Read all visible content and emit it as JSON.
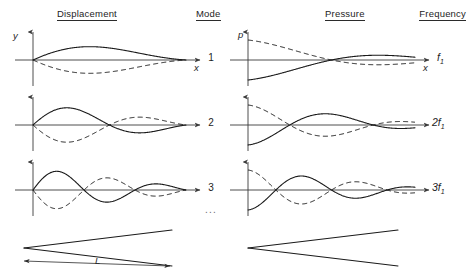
{
  "headers": {
    "displacement": "Displacement",
    "mode": "Mode",
    "pressure": "Pressure",
    "frequency": "Frequency"
  },
  "axis_labels": {
    "displacement_y": "y",
    "displacement_x": "x",
    "pressure_p": "p",
    "pressure_x": "x"
  },
  "rows": [
    {
      "mode": "1",
      "frequency": "f",
      "frequency_sub": "1",
      "displacement_lobes": 1,
      "pressure_lobes": 1
    },
    {
      "mode": "2",
      "frequency": "2f",
      "frequency_sub": "1",
      "displacement_lobes": 2,
      "pressure_lobes": 2
    },
    {
      "mode": "3",
      "frequency": "3f",
      "frequency_sub": "1",
      "displacement_lobes": 3,
      "pressure_lobes": 3
    }
  ],
  "mode_ellipsis": "...",
  "length_label": "L",
  "chart_data": {
    "type": "line",
    "xlabel": "x",
    "ylabel_left": "y",
    "ylabel_right": "p",
    "grid": false,
    "legend": "none",
    "columns": [
      "Displacement",
      "Mode",
      "Pressure",
      "Frequency"
    ],
    "series": [
      {
        "name": "Mode 1 displacement",
        "row": 1,
        "column": "Displacement",
        "start_value": 0,
        "half_cycles": 1,
        "styles": [
          "solid",
          "dashed"
        ]
      },
      {
        "name": "Mode 1 pressure",
        "row": 1,
        "column": "Pressure",
        "start_value": -1,
        "half_cycles": 1,
        "styles": [
          "solid",
          "dashed"
        ]
      },
      {
        "name": "Mode 2 displacement",
        "row": 2,
        "column": "Displacement",
        "start_value": 0,
        "half_cycles": 2,
        "styles": [
          "solid",
          "dashed"
        ]
      },
      {
        "name": "Mode 2 pressure",
        "row": 2,
        "column": "Pressure",
        "start_value": -1,
        "half_cycles": 2,
        "styles": [
          "solid",
          "dashed"
        ]
      },
      {
        "name": "Mode 3 displacement",
        "row": 3,
        "column": "Displacement",
        "start_value": 0,
        "half_cycles": 3,
        "styles": [
          "solid",
          "dashed"
        ]
      },
      {
        "name": "Mode 3 pressure",
        "row": 3,
        "column": "Pressure",
        "start_value": -1,
        "half_cycles": 3,
        "styles": [
          "solid",
          "dashed"
        ]
      }
    ],
    "frequencies": [
      "f1",
      "2f1",
      "3f1"
    ],
    "modes": [
      1,
      2,
      3
    ],
    "geometry": {
      "shape": "cone",
      "length_label": "L",
      "apex": "left",
      "open_end": "right"
    }
  }
}
